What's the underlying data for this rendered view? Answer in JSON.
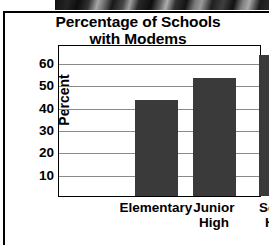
{
  "chart_data": {
    "type": "bar",
    "title_line1": "Percentage of Schools",
    "title_line2": "with Modems",
    "categories": [
      "Elementary",
      "Junior High",
      "Senior High"
    ],
    "category_labels": [
      "Elementary",
      "Junior\nHigh",
      "Senior\nHigh"
    ],
    "values": [
      43,
      53,
      63
    ],
    "xlabel": "",
    "ylabel": "Percent",
    "ylim": [
      0,
      68
    ],
    "yticks": [
      60,
      50,
      40,
      30,
      20,
      10
    ],
    "ytick_labels": [
      "60",
      "50",
      "40",
      "30",
      "20",
      "10"
    ],
    "grid": true,
    "grid_axis": "y",
    "legend": false,
    "bar_color": "#3a3a3a",
    "grid_color": "#8a8a8a",
    "frame_color": "#000000",
    "background_color": "#ffffff"
  },
  "figure": {
    "photo_strip_caption": "photo-strip-artifact"
  }
}
